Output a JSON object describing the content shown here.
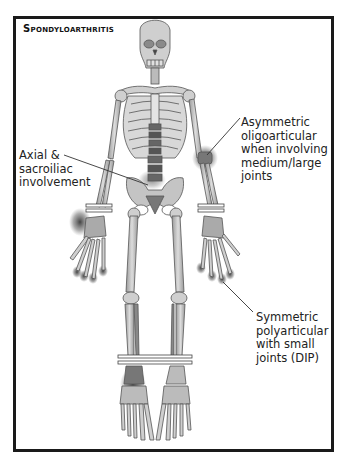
{
  "figure": {
    "title": "Spondyloarthritis",
    "annotations": [
      {
        "id": "axial",
        "text": "Axial &\nsacroiliac\ninvolvement",
        "target": "sacroiliac joints / spine"
      },
      {
        "id": "asymmetric",
        "text": "Asymmetric\noligoarticular\nwhen involving\nmedium/large\njoints",
        "target": "left elbow"
      },
      {
        "id": "symmetric",
        "text": "Symmetric\npolyarticular\nwith small\njoints (DIP)",
        "target": "fingertips (DIP joints)"
      }
    ],
    "highlighted_regions": [
      "spine",
      "sacroiliac joints",
      "left elbow",
      "right wrist",
      "fingertip DIP joints",
      "right ankle"
    ],
    "colors": {
      "border": "#1a1a1a",
      "bone_fill": "#cfcfcf",
      "bone_stroke": "#555555",
      "highlight": "#3a3a3a",
      "text": "#222222"
    }
  }
}
